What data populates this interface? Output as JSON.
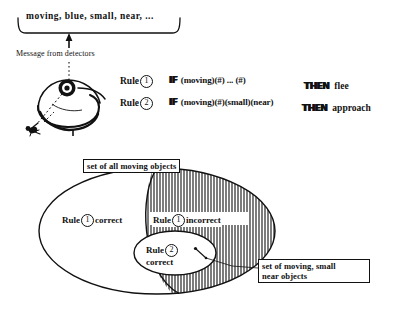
{
  "figure": {
    "message": {
      "detector_output": "moving, blue, small, near, ...",
      "caption": "Message from detectors",
      "arrow_icon": "up-arrow-icon",
      "creature_icon": "creature-with-eye-icon",
      "eye_icon": "eye-sensor-icon",
      "prey_icon": "fly-icon",
      "sightline_icon": "dashed-sightline-icon"
    },
    "rules": [
      {
        "label": "Rule",
        "number": "1",
        "if_keyword": "IF",
        "conditions": "(moving)(#) ... (#)",
        "then_keyword": "THEN",
        "action": "flee"
      },
      {
        "label": "Rule",
        "number": "2",
        "if_keyword": "IF",
        "conditions": "(moving)(#)(small)(near)",
        "then_keyword": "THEN",
        "action": "approach"
      }
    ],
    "venn": {
      "outer_label": "set of all moving objects",
      "subset_label": "set of moving, small\nnear objects",
      "subset_label_line1": "set of moving, small",
      "subset_label_line2": "near objects",
      "region_rule1_correct": "Rule ① correct",
      "region_rule1_correct_pre": "Rule",
      "region_rule1_correct_num": "1",
      "region_rule1_correct_post": "correct",
      "region_rule1_incorrect_pre": "Rule",
      "region_rule1_incorrect_num": "1",
      "region_rule1_incorrect_post": "incorrect",
      "region_rule2_correct_pre": "Rule",
      "region_rule2_correct_num": "2",
      "region_rule2_correct_post": "correct",
      "hatch_pattern": "vertical-lines",
      "leader_line_icon": "leader-line-icon"
    },
    "colors": {
      "ink": "#111111",
      "paper": "#ffffff"
    }
  }
}
